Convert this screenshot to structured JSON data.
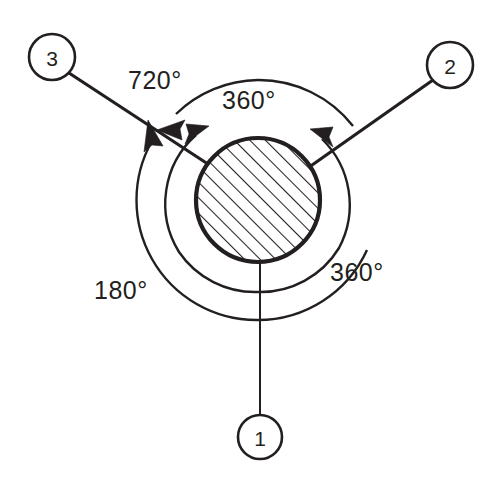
{
  "diagram": {
    "background_color": "#ffffff",
    "line_color": "#231f20",
    "balloons": [
      {
        "id": "balloon-1",
        "label": "1",
        "cx": 260,
        "cy": 437,
        "r": 22
      },
      {
        "id": "balloon-2",
        "label": "2",
        "cx": 450,
        "cy": 65,
        "r": 23
      },
      {
        "id": "balloon-3",
        "label": "3",
        "cx": 52,
        "cy": 57,
        "r": 23
      }
    ],
    "angle_labels": [
      {
        "id": "angle-720",
        "text": "720°",
        "x": 128,
        "y": 80
      },
      {
        "id": "angle-360-top",
        "text": "360°",
        "x": 222,
        "y": 100
      },
      {
        "id": "angle-360-right",
        "text": "360°",
        "x": 330,
        "y": 272
      },
      {
        "id": "angle-180",
        "text": "180°",
        "x": 94,
        "y": 290
      }
    ],
    "hatched_circle": {
      "id": "hatched-shaft",
      "cx": 258,
      "cy": 200,
      "r": 62,
      "hatch_angle_deg": 45
    },
    "arcs": [
      {
        "id": "arc-720-outer",
        "r": 120,
        "label": "720°"
      },
      {
        "id": "arc-360-inner",
        "r": 92,
        "label": "360°"
      },
      {
        "id": "arc-180-outer-left",
        "r": 120,
        "label": "180°"
      },
      {
        "id": "arc-360-right",
        "r": 120,
        "label": "360°"
      }
    ]
  }
}
